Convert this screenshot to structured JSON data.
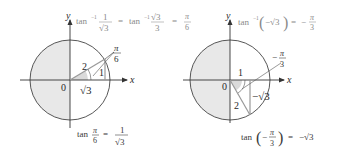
{
  "figure": {
    "left_panel": {
      "axis_labels": {
        "x": "x",
        "y": "y"
      },
      "origin_label": "0",
      "hypotenuse_label": "2",
      "opposite_label": "1",
      "adjacent_label": "√3",
      "angle_label": {
        "num": "π",
        "den": "6"
      },
      "top_equation": {
        "part1_fn": "tan",
        "part1_sup": "−1",
        "part1_num": "1",
        "part1_den": "√3",
        "eq1": "=",
        "part2_fn": "tan",
        "part2_sup": "−1",
        "part2_num": "√3",
        "part2_den": "3",
        "eq2": "=",
        "result_num": "π",
        "result_den": "6"
      },
      "bottom_equation": {
        "fn": "tan",
        "arg_num": "π",
        "arg_den": "6",
        "eq": "=",
        "result_num": "1",
        "result_den": "√3"
      }
    },
    "right_panel": {
      "axis_labels": {
        "x": "x",
        "y": "y"
      },
      "origin_label": "0",
      "adjacent_label": "1",
      "hypotenuse_label": "2",
      "opposite_label": "−√3",
      "angle_label": {
        "sign": "−",
        "num": "π",
        "den": "3"
      },
      "top_equation": {
        "fn": "tan",
        "sup": "−1",
        "lparen": "(",
        "arg": "−√3",
        "rparen": ")",
        "eq": "=",
        "sign": "−",
        "result_num": "π",
        "result_den": "3"
      },
      "bottom_equation": {
        "fn": "tan",
        "lparen": "(",
        "arg_sign": "−",
        "arg_num": "π",
        "arg_den": "3",
        "rparen": ")",
        "eq": "=",
        "result": "−√3"
      }
    },
    "colors": {
      "shade": "#e6e6e6",
      "angle_shade": "#d9d9d9",
      "line": "#333333",
      "triangle_line": "#9a9a9a",
      "text": "#2a2a2a"
    }
  }
}
